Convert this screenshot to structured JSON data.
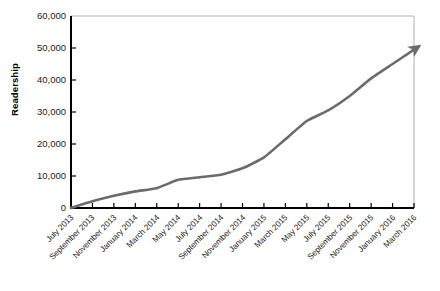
{
  "chart_data": {
    "type": "line",
    "title": "",
    "xlabel": "",
    "ylabel": "Readership",
    "ylim": [
      0,
      60000
    ],
    "grid": false,
    "legend": false,
    "legend_position": "none",
    "line_color": "#6b6b6b",
    "axis_color": "#000000",
    "frame_color": "#b0b0b0",
    "arrow_at_end": true,
    "y_ticks": [
      "0",
      "10,000",
      "20,000",
      "30,000",
      "40,000",
      "50,000",
      "60,000"
    ],
    "y_tick_values": [
      0,
      10000,
      20000,
      30000,
      40000,
      50000,
      60000
    ],
    "categories": [
      "July 2013",
      "September 2013",
      "November 2013",
      "January 2014",
      "March 2014",
      "May 2014",
      "July 2014",
      "September 2014",
      "November 2014",
      "January 2015",
      "March 2015",
      "May 2015",
      "July 2015",
      "September 2015",
      "November 2015",
      "January 2016",
      "March 2016"
    ],
    "series": [
      {
        "name": "Readership",
        "values": [
          0,
          2100,
          3800,
          5200,
          6200,
          8800,
          9600,
          10400,
          12400,
          15800,
          21500,
          27200,
          30500,
          35000,
          40500,
          45000,
          49500
        ]
      }
    ]
  }
}
